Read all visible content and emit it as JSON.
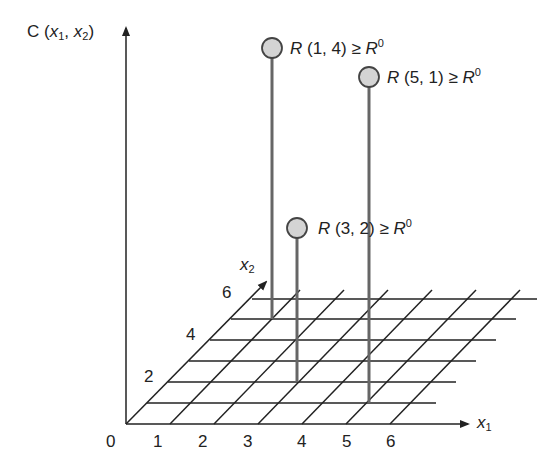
{
  "diagram": {
    "y_axis_label": {
      "var": "C",
      "args": "x1, x2"
    },
    "x1_axis_label": "x1",
    "x2_axis_label": "x2",
    "x1_ticks": [
      "0",
      "1",
      "2",
      "3",
      "4",
      "5",
      "6"
    ],
    "x2_ticks": [
      "2",
      "4",
      "6"
    ],
    "points": [
      {
        "label": "R (1, 4) ≥ R0",
        "x1": "1",
        "x2": "4",
        "threshold": "R",
        "threshold_sup": "0",
        "text": "R (1, 4) ≥ "
      },
      {
        "label": "R (5, 1) ≥ R0",
        "x1": "5",
        "x2": "1",
        "threshold": "R",
        "threshold_sup": "0",
        "text": "R (5, 1) ≥ "
      },
      {
        "label": "R (3, 2) ≥ R0",
        "x1": "3",
        "x2": "2",
        "threshold": "R",
        "threshold_sup": "0",
        "text": "R (3, 2) ≥ "
      }
    ],
    "colors": {
      "line": "#222222",
      "stem": "#666666",
      "marker_fill": "#d4d4d4",
      "marker_stroke": "#444444"
    }
  }
}
